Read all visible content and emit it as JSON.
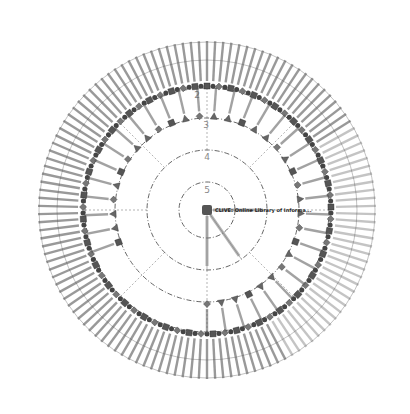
{
  "diagram": {
    "type": "radial-hierarchy",
    "center": {
      "label": "CLIVE: Online Library of Informa..."
    },
    "rings": [
      {
        "number": "5"
      },
      {
        "number": "4"
      },
      {
        "number": "3"
      },
      {
        "number": "2"
      }
    ],
    "inner_ring": {
      "node_count": 34,
      "illegible": true
    },
    "outer_ring": {
      "node_count": 130,
      "illegible": true
    },
    "spokes": {
      "count": 3,
      "illegible": true
    }
  }
}
